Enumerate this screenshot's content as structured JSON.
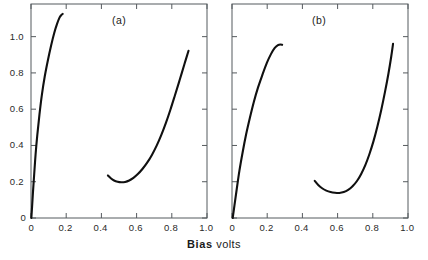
{
  "figure": {
    "axis_labels": {
      "x": "Bias",
      "x_unit": "volts",
      "y": "Current (mA) /"
    },
    "panels": [
      {
        "tag": "(a)",
        "tag_x": 112,
        "tag_y": 14,
        "frame": {
          "left": 31,
          "top": 4,
          "right": 207,
          "bottom": 218
        },
        "xticks": [
          {
            "value": 0,
            "label": "0"
          },
          {
            "value": 0.2,
            "label": "0.2"
          },
          {
            "value": 0.4,
            "label": "0.4"
          },
          {
            "value": 0.6,
            "label": "0.6"
          },
          {
            "value": 0.8,
            "label": "0.8"
          },
          {
            "value": 1.0,
            "label": "1.0"
          }
        ],
        "yticks": [
          {
            "value": 0,
            "label": "0"
          },
          {
            "value": 0.2,
            "label": "0.2"
          },
          {
            "value": 0.4,
            "label": "0.4"
          },
          {
            "value": 0.6,
            "label": "0.6"
          },
          {
            "value": 0.8,
            "label": "0.8"
          },
          {
            "value": 1.0,
            "label": "1.0"
          }
        ],
        "curves": [
          {
            "name": "forward-branch",
            "points": [
              [
                0.002,
                0.0
              ],
              [
                0.006,
                0.06
              ],
              [
                0.011,
                0.14
              ],
              [
                0.018,
                0.24
              ],
              [
                0.026,
                0.35
              ],
              [
                0.036,
                0.46
              ],
              [
                0.048,
                0.57
              ],
              [
                0.062,
                0.68
              ],
              [
                0.078,
                0.78
              ],
              [
                0.096,
                0.87
              ],
              [
                0.114,
                0.95
              ],
              [
                0.132,
                1.02
              ],
              [
                0.148,
                1.07
              ],
              [
                0.162,
                1.105
              ],
              [
                0.173,
                1.12
              ],
              [
                0.18,
                1.125
              ]
            ]
          },
          {
            "name": "reverse-branch",
            "points": [
              [
                0.437,
                0.235
              ],
              [
                0.455,
                0.218
              ],
              [
                0.472,
                0.207
              ],
              [
                0.492,
                0.2
              ],
              [
                0.512,
                0.197
              ],
              [
                0.535,
                0.199
              ],
              [
                0.558,
                0.207
              ],
              [
                0.582,
                0.221
              ],
              [
                0.607,
                0.242
              ],
              [
                0.633,
                0.27
              ],
              [
                0.66,
                0.305
              ],
              [
                0.687,
                0.348
              ],
              [
                0.714,
                0.399
              ],
              [
                0.74,
                0.457
              ],
              [
                0.766,
                0.523
              ],
              [
                0.792,
                0.597
              ],
              [
                0.818,
                0.677
              ],
              [
                0.845,
                0.762
              ],
              [
                0.872,
                0.849
              ],
              [
                0.895,
                0.922
              ]
            ]
          }
        ]
      },
      {
        "tag": "(b)",
        "tag_x": 312,
        "tag_y": 14,
        "frame": {
          "left": 232,
          "top": 4,
          "right": 408,
          "bottom": 218
        },
        "xticks": [
          {
            "value": 0,
            "label": "0"
          },
          {
            "value": 0.2,
            "label": "0.2"
          },
          {
            "value": 0.4,
            "label": "0.4"
          },
          {
            "value": 0.6,
            "label": "0.6"
          },
          {
            "value": 0.8,
            "label": "0.8"
          },
          {
            "value": 1.0,
            "label": "1.0"
          }
        ],
        "yticks": [
          {
            "value": 0,
            "label": ""
          },
          {
            "value": 0.2,
            "label": ""
          },
          {
            "value": 0.4,
            "label": ""
          },
          {
            "value": 0.6,
            "label": ""
          },
          {
            "value": 0.8,
            "label": ""
          },
          {
            "value": 1.0,
            "label": ""
          }
        ],
        "curves": [
          {
            "name": "forward-branch",
            "points": [
              [
                0.004,
                0.0
              ],
              [
                0.014,
                0.07
              ],
              [
                0.027,
                0.16
              ],
              [
                0.042,
                0.26
              ],
              [
                0.06,
                0.36
              ],
              [
                0.08,
                0.46
              ],
              [
                0.101,
                0.55
              ],
              [
                0.124,
                0.64
              ],
              [
                0.148,
                0.72
              ],
              [
                0.173,
                0.79
              ],
              [
                0.198,
                0.855
              ],
              [
                0.222,
                0.905
              ],
              [
                0.243,
                0.938
              ],
              [
                0.261,
                0.953
              ],
              [
                0.275,
                0.957
              ],
              [
                0.285,
                0.955
              ]
            ]
          },
          {
            "name": "reverse-branch",
            "points": [
              [
                0.47,
                0.205
              ],
              [
                0.49,
                0.182
              ],
              [
                0.512,
                0.164
              ],
              [
                0.536,
                0.151
              ],
              [
                0.56,
                0.143
              ],
              [
                0.585,
                0.139
              ],
              [
                0.61,
                0.138
              ],
              [
                0.635,
                0.143
              ],
              [
                0.66,
                0.155
              ],
              [
                0.685,
                0.175
              ],
              [
                0.71,
                0.204
              ],
              [
                0.734,
                0.243
              ],
              [
                0.758,
                0.293
              ],
              [
                0.781,
                0.353
              ],
              [
                0.804,
                0.424
              ],
              [
                0.826,
                0.505
              ],
              [
                0.848,
                0.596
              ],
              [
                0.869,
                0.694
              ],
              [
                0.889,
                0.797
              ],
              [
                0.905,
                0.892
              ],
              [
                0.915,
                0.96
              ]
            ]
          }
        ]
      }
    ]
  },
  "chart_data": {
    "type": "line",
    "title": "",
    "xlabel": "Bias volts",
    "ylabel": "Current (mA)",
    "xlim": [
      0,
      1.0
    ],
    "ylim": [
      0,
      1.18
    ],
    "grid": false,
    "legend": "none",
    "panels": [
      {
        "label": "(a)",
        "series": [
          {
            "name": "forward-branch",
            "x": [
              0.002,
              0.006,
              0.011,
              0.018,
              0.026,
              0.036,
              0.048,
              0.062,
              0.078,
              0.096,
              0.114,
              0.132,
              0.148,
              0.162,
              0.173,
              0.18
            ],
            "y": [
              0.0,
              0.06,
              0.14,
              0.24,
              0.35,
              0.46,
              0.57,
              0.68,
              0.78,
              0.87,
              0.95,
              1.02,
              1.07,
              1.105,
              1.12,
              1.125
            ]
          },
          {
            "name": "reverse-branch",
            "x": [
              0.437,
              0.455,
              0.472,
              0.492,
              0.512,
              0.535,
              0.558,
              0.582,
              0.607,
              0.633,
              0.66,
              0.687,
              0.714,
              0.74,
              0.766,
              0.792,
              0.818,
              0.845,
              0.872,
              0.895
            ],
            "y": [
              0.235,
              0.218,
              0.207,
              0.2,
              0.197,
              0.199,
              0.207,
              0.221,
              0.242,
              0.27,
              0.305,
              0.348,
              0.399,
              0.457,
              0.523,
              0.597,
              0.677,
              0.762,
              0.849,
              0.922
            ]
          }
        ],
        "minimum": {
          "x": 0.52,
          "y": 0.197
        },
        "peak": {
          "x": 0.18,
          "y": 1.125
        }
      },
      {
        "label": "(b)",
        "series": [
          {
            "name": "forward-branch",
            "x": [
              0.004,
              0.014,
              0.027,
              0.042,
              0.06,
              0.08,
              0.101,
              0.124,
              0.148,
              0.173,
              0.198,
              0.222,
              0.243,
              0.261,
              0.275,
              0.285
            ],
            "y": [
              0.0,
              0.07,
              0.16,
              0.26,
              0.36,
              0.46,
              0.55,
              0.64,
              0.72,
              0.79,
              0.855,
              0.905,
              0.938,
              0.953,
              0.957,
              0.955
            ]
          },
          {
            "name": "reverse-branch",
            "x": [
              0.47,
              0.49,
              0.512,
              0.536,
              0.56,
              0.585,
              0.61,
              0.635,
              0.66,
              0.685,
              0.71,
              0.734,
              0.758,
              0.781,
              0.804,
              0.826,
              0.848,
              0.869,
              0.889,
              0.905,
              0.915
            ],
            "y": [
              0.205,
              0.182,
              0.164,
              0.151,
              0.143,
              0.139,
              0.138,
              0.143,
              0.155,
              0.175,
              0.204,
              0.243,
              0.293,
              0.353,
              0.424,
              0.505,
              0.596,
              0.694,
              0.797,
              0.892,
              0.96
            ]
          }
        ],
        "minimum": {
          "x": 0.61,
          "y": 0.138
        },
        "peak": {
          "x": 0.275,
          "y": 0.957
        }
      }
    ]
  }
}
